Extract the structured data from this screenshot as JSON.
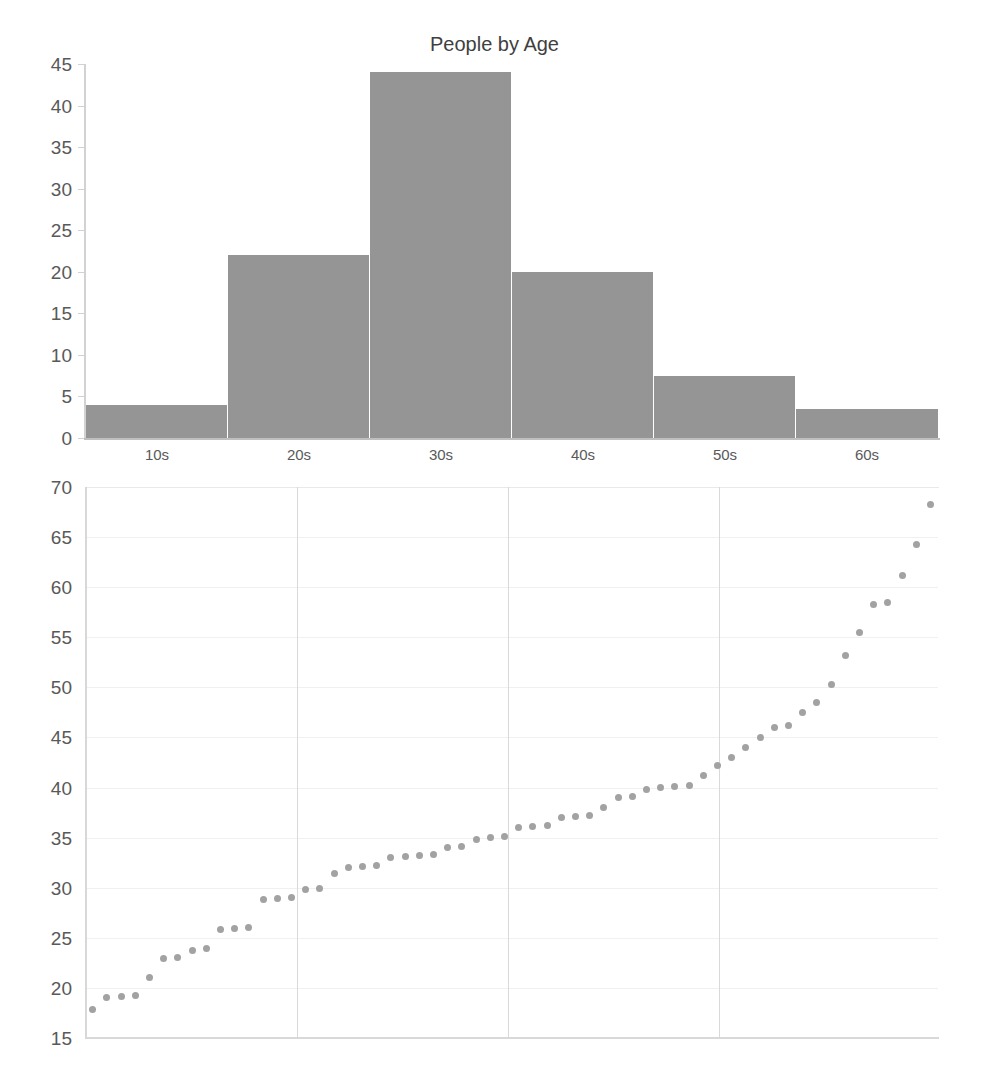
{
  "chart_data": [
    {
      "type": "bar",
      "title": "People by Age",
      "xlabel": "",
      "ylabel": "",
      "categories": [
        "10s",
        "20s",
        "30s",
        "40s",
        "50s",
        "60s"
      ],
      "values": [
        4,
        22,
        44,
        20,
        7.5,
        3.5
      ],
      "yticks": [
        0,
        5,
        10,
        15,
        20,
        25,
        30,
        35,
        40,
        45
      ],
      "ylim": [
        0,
        45
      ],
      "grid": false,
      "bar_color": "#959595",
      "axis_color": "#d2d2d2",
      "text_color": "#595959",
      "title_color": "#3f3f3f",
      "notes": "Histogram of 100 people grouped into decade-wide age bins; bars touch with thin white separators."
    },
    {
      "type": "scatter",
      "title": "",
      "xlabel": "",
      "ylabel": "",
      "yticks": [
        15,
        20,
        25,
        30,
        35,
        40,
        45,
        50,
        55,
        60,
        65,
        70
      ],
      "ylim": [
        15,
        70
      ],
      "xlim": [
        0,
        101
      ],
      "xticks": [],
      "grid": true,
      "gridlines_vertical_x": [
        25,
        50,
        75
      ],
      "point_color": "#a2a2a2",
      "values": [
        17.8,
        19.0,
        19.1,
        19.2,
        21.0,
        22.9,
        23.0,
        23.7,
        23.9,
        25.8,
        25.9,
        26.0,
        28.8,
        28.9,
        29.0,
        29.8,
        29.9,
        31.4,
        32.0,
        32.1,
        32.2,
        33.0,
        33.1,
        33.2,
        33.3,
        34.0,
        34.1,
        34.8,
        35.0,
        35.1,
        36.0,
        36.1,
        36.2,
        37.0,
        37.1,
        37.2,
        38.0,
        39.0,
        39.1,
        39.8,
        40.0,
        40.1,
        40.2,
        41.2,
        42.2,
        43.0,
        44.0,
        45.0,
        46.0,
        46.2,
        47.5,
        48.5,
        50.3,
        53.2,
        55.5,
        58.3,
        58.5,
        61.2,
        64.3,
        68.3
      ],
      "notes": "Ages of the same population sorted in ascending order, plotted as index vs age; staircase of equal-value runs."
    }
  ],
  "hist": {
    "title": "People by Age",
    "ytick_labels": [
      "45",
      "40",
      "35",
      "30",
      "25",
      "20",
      "15",
      "10",
      "5",
      "0"
    ],
    "xtick_labels": [
      "10s",
      "20s",
      "30s",
      "40s",
      "50s",
      "60s"
    ]
  },
  "scatter": {
    "ytick_labels": [
      "70",
      "65",
      "60",
      "55",
      "50",
      "45",
      "40",
      "35",
      "30",
      "25",
      "20",
      "15"
    ]
  }
}
